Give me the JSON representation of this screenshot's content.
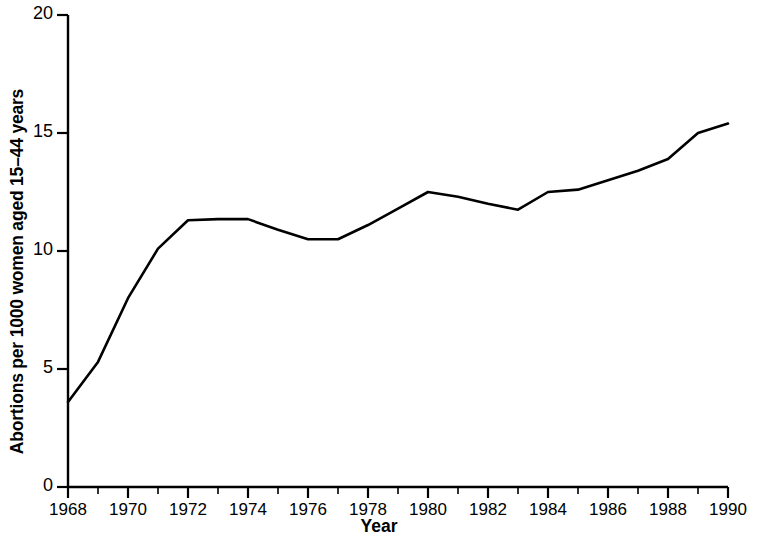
{
  "chart_data": {
    "type": "line",
    "title": "",
    "xlabel": "Year",
    "ylabel": "Abortions per 1000 women aged 15–44 years",
    "xlim": [
      1968,
      1990
    ],
    "ylim": [
      0,
      20
    ],
    "yticks": [
      0,
      5,
      10,
      15,
      20
    ],
    "ytick_labels": [
      "0",
      "5",
      "10",
      "15",
      "20"
    ],
    "xticks": [
      1968,
      1970,
      1972,
      1974,
      1976,
      1978,
      1980,
      1982,
      1984,
      1986,
      1988,
      1990
    ],
    "xtick_labels": [
      "1968",
      "1970",
      "1972",
      "1974",
      "1976",
      "1978",
      "1980",
      "1982",
      "1984",
      "1986",
      "1988",
      "1990"
    ],
    "x_minor_tick_interval": 1,
    "grid": false,
    "legend": null,
    "line_color": "#000000",
    "x": [
      1968,
      1969,
      1970,
      1971,
      1972,
      1973,
      1974,
      1975,
      1976,
      1977,
      1978,
      1979,
      1980,
      1981,
      1982,
      1983,
      1984,
      1985,
      1986,
      1987,
      1988,
      1989,
      1990
    ],
    "values": [
      3.6,
      5.3,
      8.0,
      10.1,
      11.3,
      11.35,
      11.35,
      10.9,
      10.5,
      10.5,
      11.1,
      11.8,
      12.5,
      12.3,
      12.0,
      11.75,
      12.5,
      12.6,
      13.0,
      13.4,
      13.9,
      15.0,
      15.4
    ],
    "series": [
      {
        "name": "Abortion rate",
        "values": [
          3.6,
          5.3,
          8.0,
          10.1,
          11.3,
          11.35,
          11.35,
          10.9,
          10.5,
          10.5,
          11.1,
          11.8,
          12.5,
          12.3,
          12.0,
          11.75,
          12.5,
          12.6,
          13.0,
          13.4,
          13.9,
          15.0,
          15.4
        ]
      }
    ]
  }
}
